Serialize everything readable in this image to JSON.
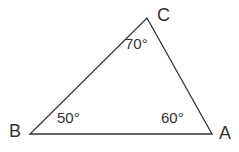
{
  "figure": {
    "kind": "geometry-triangle-diagram",
    "background_color": "#ffffff",
    "stroke_color": "#333333",
    "text_color": "#333333",
    "width": 239,
    "height": 152
  },
  "chart_data": {
    "type": "diagram",
    "subtype": "triangle",
    "title": "",
    "xlabel": "",
    "ylabel": "",
    "grid": false,
    "legend": null,
    "vertices": [
      {
        "name": "A",
        "label": "A",
        "x": 212,
        "y": 134,
        "label_x": 226,
        "label_y": 134,
        "angle_value": 60,
        "angle_label": "60°"
      },
      {
        "name": "B",
        "label": "B",
        "x": 30,
        "y": 134,
        "label_x": 16,
        "label_y": 132,
        "angle_value": 50,
        "angle_label": "50°"
      },
      {
        "name": "C",
        "label": "C",
        "x": 147,
        "y": 18,
        "label_x": 165,
        "label_y": 16,
        "angle_value": 70,
        "angle_label": "70°"
      }
    ],
    "edges": [
      {
        "from": "B",
        "to": "A",
        "label": ""
      },
      {
        "from": "B",
        "to": "C",
        "label": ""
      },
      {
        "from": "C",
        "to": "A",
        "label": ""
      }
    ],
    "angle_sum": 180,
    "angles": {
      "A": "60°",
      "B": "50°",
      "C": "70°"
    },
    "angle_label_positions": {
      "A": {
        "x": 176,
        "y": 119
      },
      "B": {
        "x": 72,
        "y": 119
      },
      "C": {
        "x": 140,
        "y": 44
      }
    },
    "polygon_points": "30,134 212,134 147,18"
  },
  "labels": {
    "vertex_a": "A",
    "vertex_b": "B",
    "vertex_c": "C",
    "angle_a": "60°",
    "angle_b": "50°",
    "angle_c": "70°"
  }
}
